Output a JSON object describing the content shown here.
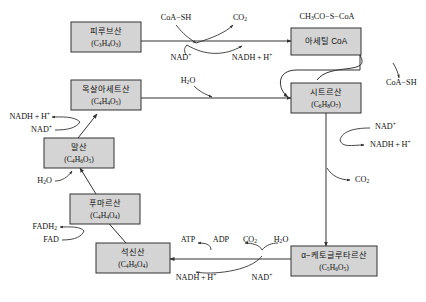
{
  "diagram": {
    "colors": {
      "box_fill": "#d4d4d4",
      "stroke": "#333333",
      "background": "#ffffff"
    },
    "boxes": {
      "pyruvic_acid": {
        "name": "피루브산",
        "formula_pre": "(C",
        "formula": "(C3H4O3)"
      },
      "acetyl_coa": {
        "name": "아세틸 CoA",
        "above_label": "CH3CO−S−CoA"
      },
      "oxaloacetic_acid": {
        "name": "옥살아세트산",
        "formula": "(C4H4O5)"
      },
      "citric_acid": {
        "name": "시트르산",
        "formula": "(C6H8O7)"
      },
      "malic_acid": {
        "name": "말산",
        "formula": "(C4H6O5)"
      },
      "fumaric_acid": {
        "name": "푸마르산",
        "formula": "(C4H4O4)"
      },
      "succinic_acid": {
        "name": "석신산",
        "formula": "(C4H6O4)"
      },
      "alpha_ketoglutaric_acid": {
        "name": "α−케토글루타르산",
        "formula": "(C5H6O5)"
      }
    },
    "cofactors": {
      "coa_sh_top": "CoA−SH",
      "co2_top": "CO2",
      "nad_top": "NAD+",
      "nadh_top": "NADH + H+",
      "acetyl_formula": "CH3CO−S−CoA",
      "coa_sh_right": "CoA−SH",
      "h2o_citrate": "H2O",
      "nad_citrate": "NAD+",
      "nadh_citrate": "NADH + H+",
      "co2_citrate": "CO2",
      "nadh_malate": "NADH + H+",
      "nad_malate": "NAD+",
      "h2o_fumarate": "H2O",
      "fadh2": "FADH2",
      "fad": "FAD",
      "atp": "ATP",
      "adp": "ADP",
      "co2_succinyl": "CO2",
      "h2o_succinyl": "H2O",
      "nadh_succinyl": "NADH + H+",
      "nad_succinyl": "NAD+"
    }
  }
}
